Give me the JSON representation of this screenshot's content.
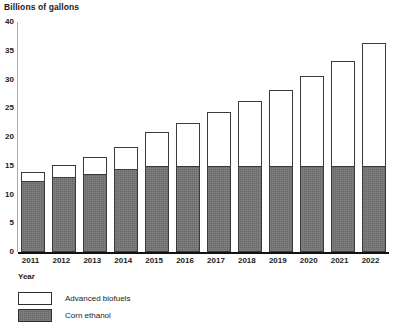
{
  "chart_data": {
    "type": "bar",
    "stacked": true,
    "title": "Billions of gallons",
    "xlabel": "Year",
    "ylabel": "",
    "categories": [
      "2011",
      "2012",
      "2013",
      "2014",
      "2015",
      "2016",
      "2017",
      "2018",
      "2019",
      "2020",
      "2021",
      "2022"
    ],
    "series": [
      {
        "name": "Corn ethanol",
        "color": "#757575",
        "values": [
          12.4,
          13.0,
          13.6,
          14.5,
          15.0,
          15.0,
          15.0,
          15.0,
          15.0,
          15.0,
          15.0,
          15.0
        ]
      },
      {
        "name": "Advanced biofuels",
        "color": "#ffffff",
        "values": [
          1.5,
          2.2,
          3.0,
          3.7,
          5.9,
          7.5,
          9.4,
          11.3,
          13.2,
          15.6,
          18.3,
          21.4
        ]
      }
    ],
    "totals": [
      13.9,
      15.2,
      16.6,
      18.2,
      20.9,
      22.5,
      24.4,
      26.3,
      28.2,
      30.6,
      33.3,
      36.4
    ],
    "ylim": [
      0,
      40
    ],
    "y_ticks": [
      0,
      5,
      10,
      15,
      20,
      25,
      30,
      35,
      40
    ],
    "y_tick_labels": [
      "0",
      "5",
      "10",
      "15",
      "20",
      "25",
      "30",
      "35",
      "40"
    ],
    "grid": false,
    "legend_position": "bottom-left",
    "legend": [
      {
        "label": "Advanced biofuels",
        "swatch": "white"
      },
      {
        "label": "Corn ethanol",
        "swatch": "gray"
      }
    ]
  }
}
